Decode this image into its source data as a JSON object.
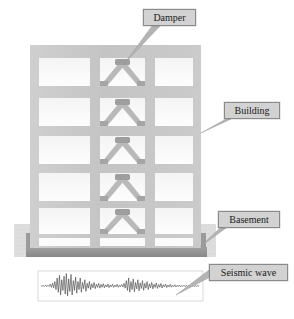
{
  "figure": {
    "type": "engineering-diagram",
    "caption": "",
    "background_color": "#ffffff"
  },
  "callouts": [
    {
      "id": "damper",
      "label": "Damper",
      "box_fill": "#d2d2d2",
      "box_border": "#8a8a8a"
    },
    {
      "id": "building",
      "label": "Building",
      "box_fill": "#d2d2d2",
      "box_border": "#8a8a8a"
    },
    {
      "id": "basement",
      "label": "Basement",
      "box_fill": "#d2d2d2",
      "box_border": "#8a8a8a"
    },
    {
      "id": "seismic",
      "label": "Seismic wave",
      "box_fill": "#d2d2d2",
      "box_border": "#8a8a8a"
    }
  ],
  "building": {
    "stories": 5,
    "bays": 3,
    "frame_color": "#c6c6c6",
    "bay_fill": "#fbfbfb",
    "damper_bay_index": 1,
    "damper_brace_color": "#b2b2b2",
    "damper_block_color": "#9a9a9a",
    "damper_count": 5,
    "x_left": 30,
    "x_right": 201,
    "y_top": 45,
    "y_bottom": 232
  },
  "basement": {
    "ground_fill": "#dcdcdc",
    "slab_fill": "#8f8f8f",
    "y_ground_top": 224,
    "y_slab_top": 248,
    "y_slab_bottom": 257
  },
  "seismic_wave": {
    "box_border": "#cfcfcf",
    "trace_color": "#4a4a4a",
    "x_left": 38,
    "x_right": 203,
    "y_top": 271,
    "y_bottom": 301,
    "baseline_y": 286,
    "samples": [
      0,
      0,
      0.5,
      -0.4,
      1,
      -0.6,
      0.8,
      -0.5,
      2,
      -1.5,
      3,
      -2,
      5,
      -4,
      9,
      -7,
      12,
      -10,
      7,
      -5,
      11,
      -9,
      14,
      -11,
      8,
      -6,
      13,
      -10,
      6,
      -5,
      10,
      -8,
      5,
      -4,
      9,
      -7,
      4,
      -3,
      7,
      -6,
      3,
      -2.5,
      5,
      -4,
      2.5,
      -2,
      4,
      -3,
      2,
      -1.6,
      3,
      -2.4,
      1.8,
      -1.4,
      2.6,
      -2,
      1.4,
      -1.2,
      2.2,
      -1.8,
      1.2,
      -1,
      2,
      -1.6,
      1,
      -0.9,
      1.8,
      -1.4,
      0.9,
      -0.8,
      1.5,
      -1.2,
      3,
      -2.4,
      6,
      -5,
      9,
      -7,
      5,
      -4,
      8,
      -6.5,
      4,
      -3.2,
      7,
      -5.5,
      3.5,
      -2.8,
      6,
      -4.8,
      3,
      -2.4,
      5,
      -4,
      2.4,
      -2,
      4,
      -3.2,
      2,
      -1.6,
      3.4,
      -2.7,
      1.7,
      -1.4,
      2.8,
      -2.2,
      1.4,
      -1.1,
      2.2,
      -1.8,
      1.1,
      -0.9,
      1.8,
      -1.4,
      0.9,
      -0.7,
      1.4,
      -1.1,
      0.7,
      -0.6,
      1.1,
      -0.9,
      0.6,
      -0.5,
      0.9,
      -0.7,
      0.5,
      -0.4,
      0.7,
      -0.6,
      0.4,
      -0.3,
      0.6,
      -0.5,
      0.3,
      -0.25,
      0.4,
      -0.3
    ]
  },
  "leaders": {
    "color": "#9b9b9b",
    "stroke": "#7d7d7d"
  }
}
